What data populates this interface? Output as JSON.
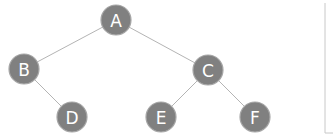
{
  "diagram": {
    "type": "binary-tree",
    "colors": {
      "node_fill": "#808080",
      "node_text": "#ffffff",
      "edge": "#b4b4b4"
    },
    "nodes": [
      {
        "id": "A",
        "label": "A",
        "level": 0
      },
      {
        "id": "B",
        "label": "B",
        "level": 1
      },
      {
        "id": "C",
        "label": "C",
        "level": 1
      },
      {
        "id": "D",
        "label": "D",
        "level": 2
      },
      {
        "id": "E",
        "label": "E",
        "level": 2
      },
      {
        "id": "F",
        "label": "F",
        "level": 2
      }
    ],
    "edges": [
      {
        "from": "A",
        "to": "B"
      },
      {
        "from": "A",
        "to": "C"
      },
      {
        "from": "B",
        "to": "D"
      },
      {
        "from": "C",
        "to": "E"
      },
      {
        "from": "C",
        "to": "F"
      }
    ]
  }
}
